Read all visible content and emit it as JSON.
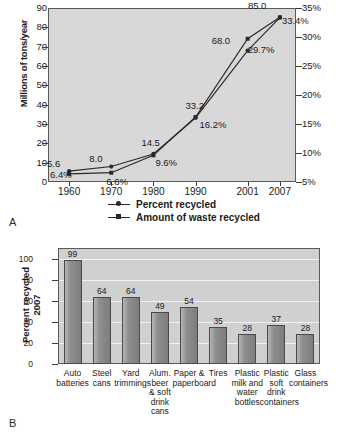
{
  "figure_a": {
    "panel_letter": "A",
    "ylabel_left": "Millions of tons/year",
    "legend": [
      {
        "label": "Percent recycled",
        "marker": "round-dot-marker"
      },
      {
        "label": "Amount of waste recycled",
        "marker": "square-dot-marker"
      }
    ],
    "chart_data": {
      "type": "line",
      "title": "",
      "xlabel": "",
      "ylabel": "Millions of tons/year",
      "y2label": "",
      "grid": false,
      "legend_position": "bottom",
      "x": [
        "1960",
        "1970",
        "1980",
        "1990",
        "2001",
        "2007"
      ],
      "ylim": [
        0,
        90
      ],
      "yticks": [
        0,
        10,
        20,
        30,
        40,
        50,
        60,
        70,
        80,
        90
      ],
      "y2lim": [
        5,
        35
      ],
      "y2ticks": [
        "5%",
        "10%",
        "15%",
        "20%",
        "25%",
        "30%",
        "35%"
      ],
      "series": [
        {
          "name": "Amount of waste recycled",
          "axis": "left",
          "unit": "million tons/year",
          "values": [
            5.6,
            8.0,
            14.5,
            33.2,
            68.0,
            85.0
          ],
          "labels": [
            "5.6",
            "8.0",
            "14.5",
            "33.2",
            "68.0",
            "85.0"
          ]
        },
        {
          "name": "Percent recycled",
          "axis": "right",
          "unit": "percent",
          "values": [
            6.4,
            6.6,
            9.6,
            16.2,
            29.7,
            33.4
          ],
          "labels": [
            "6.4%",
            "6.6%",
            "9.6%",
            "16.2%",
            "29.7%",
            "33.4%"
          ]
        }
      ]
    }
  },
  "figure_b": {
    "panel_letter": "B",
    "ylabel": "Percent recycled 2007",
    "ylabel_line1": "Percent recycled",
    "ylabel_line2": "2007",
    "chart_data": {
      "type": "bar",
      "title": "",
      "xlabel": "",
      "ylabel": "Percent recycled 2007",
      "grid": true,
      "ylim": [
        0,
        110
      ],
      "yticks": [
        0,
        20,
        40,
        60,
        80,
        100
      ],
      "categories": [
        "Auto batteries",
        "Steel cans",
        "Yard trimmings",
        "Alum. beer & soft drink cans",
        "Paper & paperboard",
        "Tires",
        "Plastic milk and water bottles",
        "Plastic soft drink containers",
        "Glass containers"
      ],
      "category_lines": [
        [
          "Auto",
          "batteries"
        ],
        [
          "Steel",
          "cans"
        ],
        [
          "Yard",
          "trimmings"
        ],
        [
          "Alum.",
          "beer",
          "& soft",
          "drink",
          "cans"
        ],
        [
          "Paper &",
          "paperboard"
        ],
        [
          "Tires"
        ],
        [
          "Plastic",
          "milk and",
          "water",
          "bottles"
        ],
        [
          "Plastic",
          "soft",
          "drink",
          "containers"
        ],
        [
          "Glass",
          "containers"
        ]
      ],
      "values": [
        99,
        64,
        64,
        49,
        54,
        35,
        28,
        37,
        28
      ],
      "value_labels": [
        "99",
        "64",
        "64",
        "49",
        "54",
        "35",
        "28",
        "37",
        "28"
      ]
    }
  },
  "colors": {
    "plot_background_a": "#d8d8d8",
    "plot_background_b": "#d0d0d0",
    "bar_fill": "#8e8e8e",
    "axis": "#5a5a5a",
    "line": "#2a2a2a",
    "gridline": "#f2f2f2",
    "text": "#1a1a1a"
  }
}
